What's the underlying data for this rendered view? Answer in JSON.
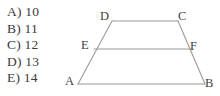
{
  "answer_choices": {
    "name": "multiple-choice-options",
    "items": [
      {
        "key": "A)",
        "value": "10"
      },
      {
        "key": "B)",
        "value": "11"
      },
      {
        "key": "C)",
        "value": "12"
      },
      {
        "key": "D)",
        "value": "13"
      },
      {
        "key": "E)",
        "value": "14"
      }
    ]
  },
  "figure": {
    "type": "geometry-diagram",
    "shape": "trapezoid",
    "line_color": "#9a9a9a",
    "label_color": "#454545",
    "background": "#ffffff",
    "vertices": {
      "A": {
        "label": "A",
        "x": 78,
        "y": 84
      },
      "B": {
        "label": "B",
        "x": 205,
        "y": 84
      },
      "C": {
        "label": "C",
        "x": 178,
        "y": 21
      },
      "D": {
        "label": "D",
        "x": 112,
        "y": 21
      },
      "E": {
        "label": "E",
        "x": 94,
        "y": 49
      },
      "F": {
        "label": "F",
        "x": 193,
        "y": 49
      }
    },
    "segments": [
      {
        "name": "AB",
        "from": "A",
        "to": "B"
      },
      {
        "name": "DC",
        "from": "D",
        "to": "C"
      },
      {
        "name": "EF",
        "from": "E",
        "to": "F"
      },
      {
        "name": "AD",
        "from": "A",
        "to": "D"
      },
      {
        "name": "BC",
        "from": "B",
        "to": "C"
      }
    ]
  }
}
